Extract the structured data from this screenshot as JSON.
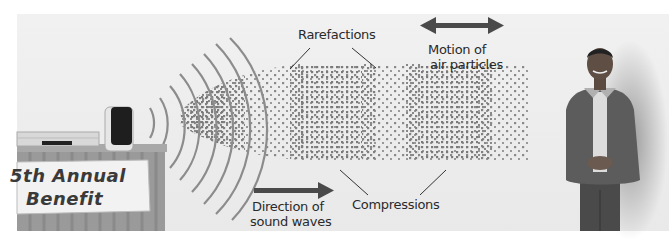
{
  "figure": {
    "labels": {
      "rarefactions": "Rarefactions",
      "motion_line1": "Motion of",
      "motion_line2": "air particles",
      "compressions": "Compressions",
      "direction_line1": "Direction of",
      "direction_line2": "sound waves"
    },
    "banner": {
      "line1": "5th Annual",
      "line2": "Benefit"
    },
    "colors": {
      "background": "#ececec",
      "particles": "#7a7a7a",
      "arrows": "#4a4a4a",
      "text": "#2a2a2a"
    }
  }
}
